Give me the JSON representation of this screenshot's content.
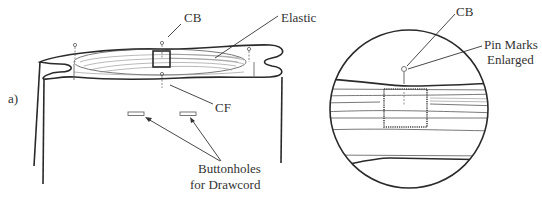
{
  "figure": {
    "panel_label": "a)",
    "left_view": {
      "labels": {
        "cb": "CB",
        "elastic": "Elastic",
        "cf": "CF",
        "buttonholes_line1": "Buttonholes",
        "buttonholes_line2": "for Drawcord"
      }
    },
    "detail_view": {
      "labels": {
        "cb": "CB",
        "pin_marks_line1": "Pin Marks",
        "pin_marks_line2": "Enlarged"
      }
    },
    "colors": {
      "line": "#2a2a2a",
      "background": "#ffffff"
    }
  }
}
